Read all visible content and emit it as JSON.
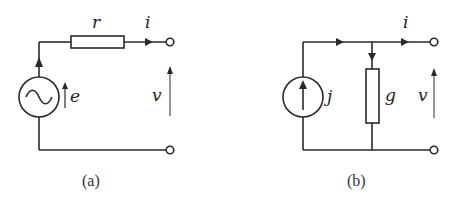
{
  "figures": [
    {
      "id": "a",
      "caption": "(a)",
      "labels": {
        "resistor": "r",
        "current": "i",
        "emf": "e",
        "voltage": "v"
      },
      "components": [
        "ac-voltage-source",
        "series-resistor",
        "output-terminals"
      ]
    },
    {
      "id": "b",
      "caption": "(b)",
      "labels": {
        "source": "j",
        "conductance": "g",
        "current": "i",
        "voltage": "v"
      },
      "components": [
        "current-source",
        "shunt-conductance",
        "output-terminals"
      ]
    }
  ],
  "colors": {
    "line": "#2a2a2a",
    "background": "#ffffff"
  }
}
